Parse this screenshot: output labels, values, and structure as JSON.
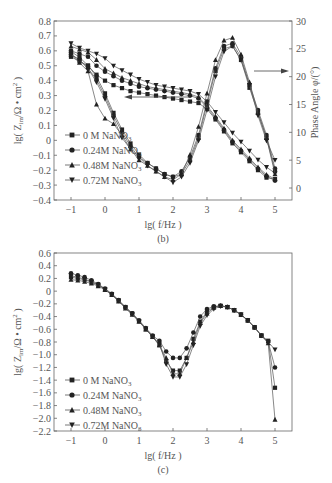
{
  "chart_data": [
    {
      "id": "b",
      "type": "line",
      "caption": "(b)",
      "xlabel": "lg( f/Hz )",
      "ylabel": "lg(Z_im/Ω·cm²)",
      "ylabel_right": "Phase Angle φ/(°)",
      "xlim": [
        -1.5,
        5.5
      ],
      "ylim": [
        -0.4,
        0.8
      ],
      "ylim_right": [
        -2,
        30
      ],
      "xticks": [
        "-1",
        "0",
        "1",
        "2",
        "3",
        "4",
        "5"
      ],
      "yticks": [
        "0.8",
        "0.7",
        "0.6",
        "0.5",
        "0.4",
        "0.3",
        "0.2",
        "0.1",
        "0",
        "-0.1",
        "-0.2",
        "-0.3",
        "-0.4"
      ],
      "yticks_right": [
        "30",
        "25",
        "20",
        "15",
        "10",
        "5",
        "0"
      ],
      "legend": [
        "0 M NaNO3",
        "0.24M NaNO3",
        "0.48M NaNO3",
        "0.72M NaNO3"
      ],
      "legend_position": "lower left",
      "annotations": [
        "arrow left: Zim curves → left axis",
        "arrow right: phase curves → right axis"
      ],
      "x": [
        -1,
        -0.75,
        -0.5,
        -0.25,
        0,
        0.25,
        0.5,
        0.75,
        1,
        1.25,
        1.5,
        1.75,
        2,
        2.25,
        2.5,
        2.75,
        3,
        3.25,
        3.5,
        3.75,
        4,
        4.25,
        4.5,
        4.75,
        5
      ],
      "series": [
        {
          "name": "0 M NaNO3 (Zim)",
          "axis": "left",
          "marker": "square",
          "values": [
            0.56,
            0.53,
            0.5,
            0.44,
            0.4,
            0.37,
            0.35,
            0.33,
            0.32,
            0.31,
            0.3,
            0.29,
            0.28,
            0.27,
            0.26,
            0.25,
            0.21,
            0.14,
            0.06,
            -0.02,
            -0.08,
            -0.14,
            -0.2,
            -0.25,
            -0.26
          ]
        },
        {
          "name": "0.24M NaNO3 (Zim)",
          "axis": "left",
          "marker": "circle",
          "values": [
            0.6,
            0.58,
            0.56,
            0.5,
            0.46,
            0.43,
            0.4,
            0.38,
            0.36,
            0.35,
            0.34,
            0.33,
            0.32,
            0.31,
            0.3,
            0.28,
            0.22,
            0.15,
            0.07,
            -0.01,
            -0.07,
            -0.13,
            -0.19,
            -0.24,
            -0.27
          ]
        },
        {
          "name": "0.48M NaNO3 (Zim)",
          "axis": "left",
          "marker": "triangle-up",
          "values": [
            0.63,
            0.61,
            0.59,
            0.54,
            0.48,
            0.45,
            0.42,
            0.4,
            0.38,
            0.36,
            0.35,
            0.34,
            0.33,
            0.32,
            0.31,
            0.29,
            0.23,
            0.16,
            0.08,
            0.0,
            -0.06,
            -0.12,
            -0.18,
            -0.23,
            -0.26
          ]
        },
        {
          "name": "0.72M NaNO3 (Zim)",
          "axis": "left",
          "marker": "triangle-down",
          "values": [
            0.65,
            0.62,
            0.6,
            0.58,
            0.55,
            0.5,
            0.47,
            0.44,
            0.41,
            0.39,
            0.37,
            0.36,
            0.35,
            0.34,
            0.33,
            0.31,
            0.26,
            0.19,
            0.12,
            0.05,
            -0.01,
            -0.07,
            -0.13,
            -0.18,
            -0.22
          ]
        },
        {
          "name": "0 M NaNO3 (Phase)",
          "axis": "right",
          "marker": "square",
          "values": [
            24.5,
            23.5,
            22.0,
            20.0,
            17.0,
            13.5,
            10.5,
            8.0,
            6.0,
            4.5,
            3.5,
            2.5,
            2.0,
            2.5,
            5.0,
            9.0,
            15.0,
            21.0,
            25.0,
            25.5,
            23.0,
            18.0,
            13.5,
            9.0,
            3.0
          ]
        },
        {
          "name": "0.24M NaNO3 (Phase)",
          "axis": "right",
          "marker": "circle",
          "values": [
            24.0,
            23.0,
            21.5,
            19.5,
            16.5,
            13.0,
            10.0,
            7.5,
            5.5,
            4.5,
            3.5,
            2.5,
            2.0,
            3.0,
            5.5,
            9.5,
            15.5,
            21.5,
            25.5,
            26.0,
            23.5,
            18.5,
            14.0,
            9.5,
            3.5
          ]
        },
        {
          "name": "0.48M NaNO3 (Phase)",
          "axis": "right",
          "marker": "triangle-up",
          "values": [
            24.0,
            22.5,
            21.0,
            15.0,
            12.5,
            11.5,
            9.5,
            7.0,
            5.0,
            4.0,
            3.0,
            2.0,
            1.5,
            2.5,
            6.0,
            11.0,
            17.0,
            23.0,
            26.5,
            27.0,
            24.0,
            19.0,
            13.5,
            9.0,
            2.5
          ]
        },
        {
          "name": "0.72M NaNO3 (Phase)",
          "axis": "right",
          "marker": "triangle-down",
          "values": [
            24.0,
            23.0,
            21.5,
            19.0,
            16.0,
            12.5,
            9.0,
            7.0,
            5.5,
            4.0,
            3.0,
            2.0,
            1.0,
            2.0,
            4.5,
            8.5,
            14.0,
            20.0,
            24.5,
            25.5,
            23.0,
            18.5,
            13.0,
            8.5,
            5.0
          ]
        }
      ]
    },
    {
      "id": "c",
      "type": "line",
      "caption": "(c)",
      "xlabel": "lg( f/Hz )",
      "ylabel": "lg(Z_im/Ω·cm²)",
      "xlim": [
        -1.5,
        5.5
      ],
      "ylim": [
        -2.2,
        0.6
      ],
      "xticks": [
        "-1",
        "0",
        "1",
        "2",
        "3",
        "4",
        "5"
      ],
      "yticks": [
        "0.6",
        "0.4",
        "0.2",
        "0",
        "-0.2",
        "-0.4",
        "-0.6",
        "-0.8",
        "-1.0",
        "-1.2",
        "-1.4",
        "-1.6",
        "-1.8",
        "-2.0",
        "-2.2"
      ],
      "legend": [
        "0 M NaNO3",
        "0.24M NaNO3",
        "0.48M NaNO3",
        "0.72M NaNO3"
      ],
      "legend_position": "lower left",
      "x": [
        -1,
        -0.8,
        -0.6,
        -0.4,
        -0.2,
        0,
        0.2,
        0.4,
        0.6,
        0.8,
        1,
        1.2,
        1.4,
        1.6,
        1.8,
        2,
        2.2,
        2.4,
        2.6,
        2.8,
        3,
        3.2,
        3.4,
        3.6,
        3.8,
        4,
        4.2,
        4.4,
        4.6,
        4.8,
        5
      ],
      "series": [
        {
          "name": "0 M NaNO3",
          "marker": "square",
          "values": [
            0.22,
            0.2,
            0.18,
            0.14,
            0.1,
            0.03,
            -0.05,
            -0.15,
            -0.25,
            -0.35,
            -0.47,
            -0.6,
            -0.72,
            -0.85,
            -1.1,
            -1.25,
            -1.25,
            -1.05,
            -0.75,
            -0.48,
            -0.32,
            -0.25,
            -0.23,
            -0.25,
            -0.3,
            -0.37,
            -0.46,
            -0.57,
            -0.7,
            -0.78,
            -1.52
          ]
        },
        {
          "name": "0.24M NaNO3",
          "marker": "circle",
          "values": [
            0.28,
            0.25,
            0.22,
            0.17,
            0.11,
            0.04,
            -0.04,
            -0.14,
            -0.25,
            -0.35,
            -0.46,
            -0.58,
            -0.7,
            -0.78,
            -0.95,
            -1.05,
            -1.05,
            -0.9,
            -0.65,
            -0.4,
            -0.28,
            -0.24,
            -0.23,
            -0.25,
            -0.3,
            -0.37,
            -0.46,
            -0.57,
            -0.7,
            -0.8,
            -1.2
          ]
        },
        {
          "name": "0.48M NaNO3",
          "marker": "triangle-up",
          "values": [
            0.18,
            0.17,
            0.15,
            0.12,
            0.08,
            0.02,
            -0.06,
            -0.16,
            -0.27,
            -0.37,
            -0.48,
            -0.6,
            -0.72,
            -0.85,
            -1.05,
            -1.3,
            -1.3,
            -1.05,
            -0.8,
            -0.5,
            -0.35,
            -0.26,
            -0.23,
            -0.25,
            -0.3,
            -0.37,
            -0.46,
            -0.57,
            -0.7,
            -0.82,
            -2.02
          ]
        },
        {
          "name": "0.72M NaNO3",
          "marker": "triangle-down",
          "values": [
            0.24,
            0.22,
            0.19,
            0.15,
            0.1,
            0.03,
            -0.05,
            -0.15,
            -0.26,
            -0.36,
            -0.47,
            -0.59,
            -0.71,
            -0.83,
            -1.15,
            -1.35,
            -1.35,
            -1.15,
            -0.85,
            -0.55,
            -0.38,
            -0.28,
            -0.24,
            -0.25,
            -0.3,
            -0.37,
            -0.46,
            -0.57,
            -0.7,
            -0.8,
            -0.92
          ]
        }
      ]
    }
  ],
  "figure": {
    "b": {
      "caption": "(b)",
      "xlabel": "lg( f/Hz )",
      "ylabel_main": "lg( Z",
      "ylabel_sub": "im",
      "ylabel_rest": "/Ω • cm",
      "ylabel_sup": "2",
      "ylabel_end": " )",
      "ylabel_right": "Phase Angle φ/(°)",
      "legend": [
        {
          "label": "0 M NaNO",
          "sub": "3"
        },
        {
          "label": "0.24M NaNO",
          "sub": "3"
        },
        {
          "label": "0.48M NaNO",
          "sub": "3"
        },
        {
          "label": "0.72M NaNO",
          "sub": "3"
        }
      ]
    },
    "c": {
      "caption": "(c)",
      "xlabel": "lg( f/Hz )",
      "ylabel_main": "lg( Z",
      "ylabel_sub": "im",
      "ylabel_rest": "/Ω • cm",
      "ylabel_sup": "2",
      "ylabel_end": " )",
      "legend": [
        {
          "label": "0 M NaNO",
          "sub": "3"
        },
        {
          "label": "0.24M NaNO",
          "sub": "3"
        },
        {
          "label": "0.48M NaNO",
          "sub": "3"
        },
        {
          "label": "0.72M NaNO",
          "sub": "3"
        }
      ]
    }
  }
}
